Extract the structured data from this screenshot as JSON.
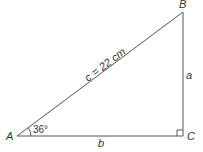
{
  "diagram": {
    "type": "right-triangle",
    "vertices": {
      "A": "A",
      "B": "B",
      "C": "C"
    },
    "sides": {
      "hypotenuse": "c = 22 cm",
      "opposite": "a",
      "adjacent": "b"
    },
    "angle_A": "36°",
    "right_angle_at": "C",
    "stroke_color": "#555555",
    "text_color": "#333333"
  }
}
